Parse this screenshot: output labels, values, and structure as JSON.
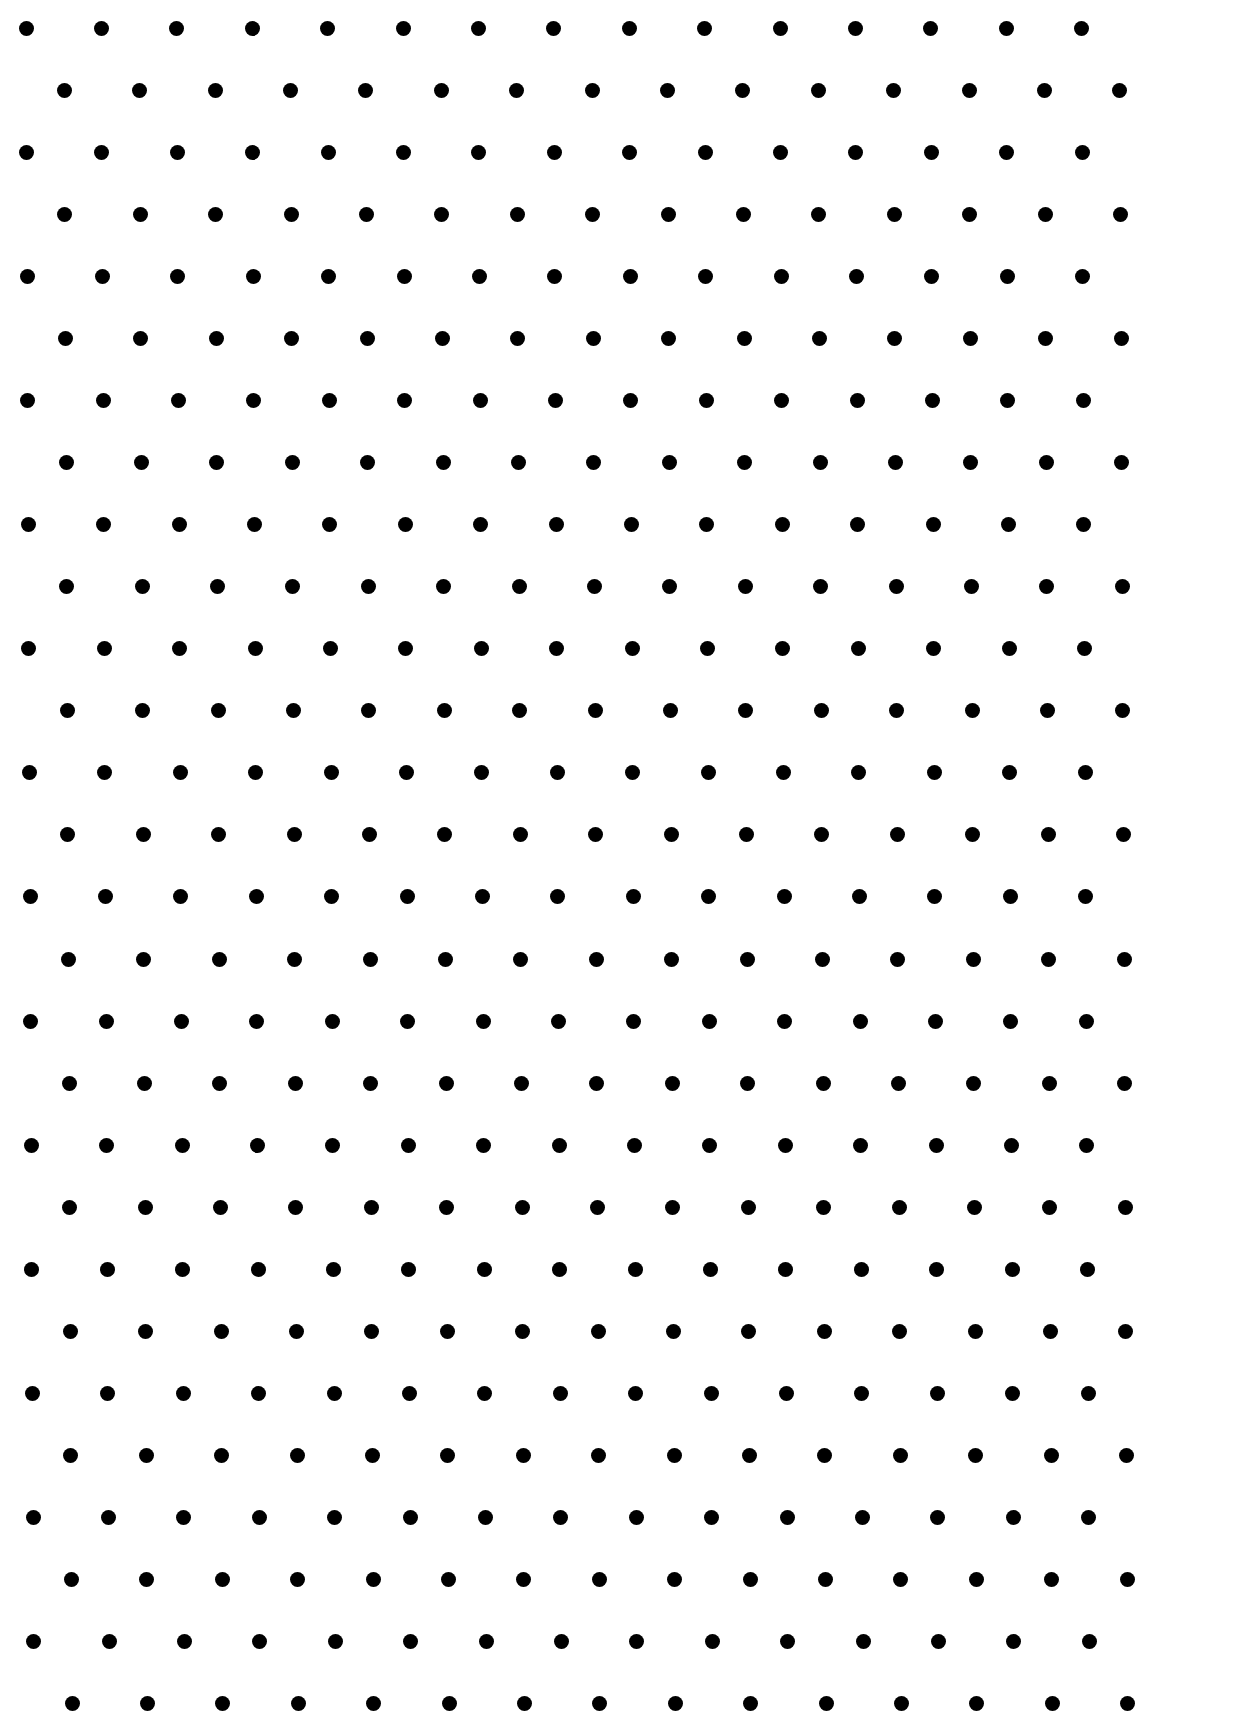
{
  "page": {
    "width": 1234,
    "height": 1734,
    "background": "#ffffff"
  },
  "pattern": {
    "type": "staggered-dot-grid",
    "dot_color": "#000000",
    "dot_diameter": 15,
    "rows": 28,
    "dots_per_row": 15,
    "row_spacing": 62.07,
    "col_spacing": 75.4,
    "first_row_y": 28,
    "even_row_start_x": 26,
    "odd_row_start_x": 64,
    "horizontal_drift_total": 8
  }
}
